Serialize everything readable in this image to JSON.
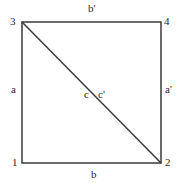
{
  "diagram": {
    "type": "square-with-diagonal",
    "stroke_color": "#3a3a3a",
    "vertices": [
      {
        "label": "1",
        "position": "bottom-left"
      },
      {
        "label": "2",
        "position": "bottom-right"
      },
      {
        "label": "3",
        "position": "top-left"
      },
      {
        "label": "4",
        "position": "top-right"
      }
    ],
    "edges": {
      "left": "a",
      "right": "a'",
      "top": "b'",
      "bottom": "b",
      "diagonal_left": "c",
      "diagonal_right": "c'"
    }
  }
}
